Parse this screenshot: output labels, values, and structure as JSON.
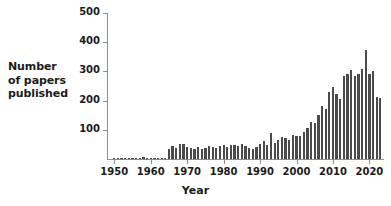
{
  "chart_data": {
    "type": "bar",
    "title": "",
    "subtitle": "",
    "xlabel": "Year",
    "ylabel": "Number of papers published",
    "ylabel_lines": [
      "Number",
      "of papers",
      "published"
    ],
    "xlim": [
      1948,
      2024
    ],
    "ylim": [
      0,
      500
    ],
    "ytick_values": [
      100,
      200,
      300,
      400,
      500
    ],
    "ytick_labels": [
      "100",
      "200",
      "300",
      "400",
      "500"
    ],
    "xtick_values": [
      1950,
      1960,
      1970,
      1980,
      1990,
      2000,
      2010,
      2020
    ],
    "xtick_labels": [
      "1950",
      "1960",
      "1970",
      "1980",
      "1990",
      "2000",
      "2010",
      "2020"
    ],
    "grid": false,
    "legend": null,
    "bar_color": "#4a4a4a",
    "axis_color": "#8d8d8d",
    "background_color": "#ffffff",
    "text_color": "#1b1b1b",
    "categories": [
      1950,
      1951,
      1952,
      1953,
      1954,
      1955,
      1956,
      1957,
      1958,
      1959,
      1960,
      1961,
      1962,
      1963,
      1964,
      1965,
      1966,
      1967,
      1968,
      1969,
      1970,
      1971,
      1972,
      1973,
      1974,
      1975,
      1976,
      1977,
      1978,
      1979,
      1980,
      1981,
      1982,
      1983,
      1984,
      1985,
      1986,
      1987,
      1988,
      1989,
      1990,
      1991,
      1992,
      1993,
      1994,
      1995,
      1996,
      1997,
      1998,
      1999,
      2000,
      2001,
      2002,
      2003,
      2004,
      2005,
      2006,
      2007,
      2008,
      2009,
      2010,
      2011,
      2012,
      2013,
      2014,
      2015,
      2016,
      2017,
      2018,
      2019,
      2020,
      2021,
      2022,
      2023
    ],
    "values": [
      1,
      1,
      2,
      2,
      2,
      3,
      3,
      4,
      6,
      4,
      3,
      3,
      4,
      4,
      5,
      33,
      43,
      38,
      50,
      52,
      42,
      37,
      34,
      40,
      33,
      37,
      44,
      41,
      37,
      46,
      49,
      40,
      47,
      49,
      44,
      50,
      45,
      37,
      34,
      41,
      52,
      60,
      48,
      88,
      55,
      65,
      75,
      72,
      66,
      83,
      80,
      78,
      93,
      107,
      128,
      125,
      150,
      180,
      170,
      230,
      245,
      222,
      205,
      285,
      290,
      305,
      285,
      290,
      308,
      375,
      290,
      300,
      212,
      210
    ]
  }
}
